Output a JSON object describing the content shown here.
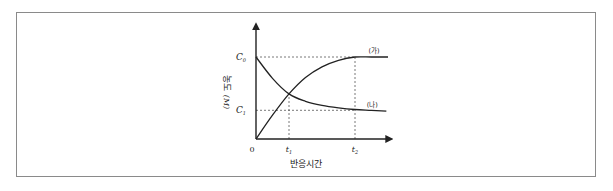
{
  "chart_data": {
    "type": "line",
    "title": "",
    "xlabel": "반응시간",
    "ylabel": "농도",
    "ylabel_unit": "(M)",
    "x_ticks": [
      {
        "label": "0",
        "value": 0
      },
      {
        "label": "t",
        "sub": "1",
        "value": 1
      },
      {
        "label": "t",
        "sub": "2",
        "value": 3
      }
    ],
    "y_ticks": [
      {
        "label": "C",
        "sub": "0",
        "value": 1.0
      },
      {
        "label": "C",
        "sub": "1",
        "value": 0.35
      }
    ],
    "xlim": [
      0,
      4.1
    ],
    "ylim": [
      0,
      1.4
    ],
    "grid": false,
    "reference_lines": [
      {
        "orientation": "horizontal",
        "y": 1.0,
        "x_to": 3,
        "style": "dashed"
      },
      {
        "orientation": "horizontal",
        "y": 0.35,
        "x_to": 3,
        "style": "dashed"
      },
      {
        "orientation": "vertical",
        "x": 1,
        "y_to": 0.55,
        "style": "dashed"
      },
      {
        "orientation": "vertical",
        "x": 3,
        "y_to": 1.0,
        "style": "dashed"
      }
    ],
    "series": [
      {
        "name": "(가)",
        "description": "product concentration rises from 0 to C0",
        "x": [
          0,
          0.5,
          1,
          1.5,
          2,
          2.5,
          3,
          3.5,
          4.0
        ],
        "y": [
          0,
          0.29,
          0.55,
          0.75,
          0.88,
          0.96,
          1.0,
          1.0,
          1.0
        ]
      },
      {
        "name": "(나)",
        "description": "reactant concentration decays from C0 toward C1",
        "x": [
          0,
          0.5,
          1,
          1.5,
          2,
          2.5,
          3,
          3.5,
          3.95
        ],
        "y": [
          1.0,
          0.74,
          0.55,
          0.46,
          0.41,
          0.38,
          0.36,
          0.35,
          0.34
        ]
      }
    ]
  }
}
